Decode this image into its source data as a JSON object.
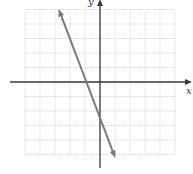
{
  "chart_data": {
    "type": "line",
    "title": "",
    "xlabel": "x",
    "ylabel": "y",
    "xlim": [
      -5,
      5
    ],
    "ylim": [
      -5,
      5
    ],
    "grid": true,
    "grid_style": "dotted",
    "tick_labels": false,
    "series": [
      {
        "name": "line",
        "description": "Straight line with arrows at both ends, negative slope, x-intercept near -1, y-intercept near -2.5",
        "x": [
          -2.67,
          0.93
        ],
        "y": [
          4.8,
          -5.0
        ],
        "x_intercept": -1,
        "y_intercept": -2.5,
        "color": "#7a7a7a"
      }
    ]
  },
  "colors": {
    "axis": "#3a3a3a",
    "grid": "#c8c8c8",
    "line": "#7a7a7a"
  },
  "labels": {
    "x_axis": "x",
    "y_axis": "y"
  }
}
